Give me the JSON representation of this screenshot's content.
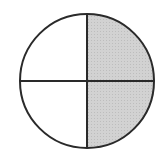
{
  "figure": {
    "type": "fraction-circle",
    "total_parts": 4,
    "shaded_parts": 2,
    "shaded_quadrants": [
      "top-right",
      "bottom-right"
    ],
    "colors": {
      "background": "#ffffff",
      "outline": "#2a2a2a",
      "shaded_fill": "#d2d2d2",
      "unshaded_fill": "#ffffff"
    },
    "geometry": {
      "cx": 87,
      "cy": 81,
      "r": 67
    }
  }
}
